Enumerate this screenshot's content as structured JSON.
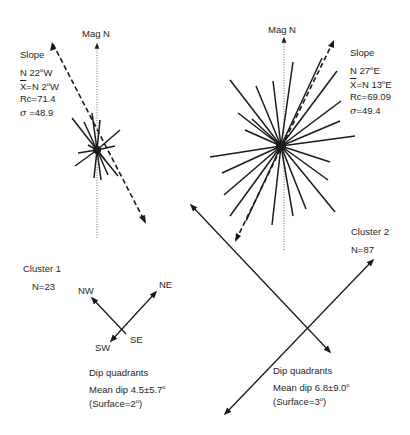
{
  "diagram": {
    "type": "rose-diagram-comparison",
    "north_label": "Mag N",
    "clusters": [
      {
        "name": "Cluster 1",
        "n_label": "N=23",
        "slope": {
          "title": "Slope",
          "direction": "N 22",
          "direction_unit": "W",
          "mean_prefix": "X",
          "mean": "=N  2",
          "mean_unit": "W",
          "rc": "Rc=71.4",
          "sigma_symbol": "σ",
          "sigma": " =48.9"
        },
        "dip_quadrants": {
          "title": "Dip quadrants",
          "mean_dip": "Mean dip  4.5±5.7",
          "surface": "(Surface=2",
          "surface_close": ")",
          "quadrant_labels": [
            "NW",
            "NE",
            "SW",
            "SE"
          ]
        }
      },
      {
        "name": "Cluster 2",
        "n_label": "N=87",
        "slope": {
          "title": "Slope",
          "direction": "N 27",
          "direction_unit": "E",
          "mean_prefix": "X",
          "mean": "=N 13",
          "mean_unit": "E",
          "rc": "Rc=69.09",
          "sigma_symbol": "σ",
          "sigma": "=49.4"
        },
        "dip_quadrants": {
          "title": "Dip quadrants",
          "mean_dip": "Mean dip  6.8±9.0",
          "surface": "(Surface=3",
          "surface_close": ")"
        }
      }
    ],
    "degree_symbol": "o",
    "colors": {
      "ink": "#1a1a1a",
      "background": "#ffffff"
    }
  }
}
